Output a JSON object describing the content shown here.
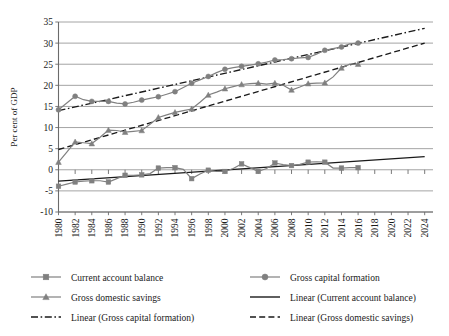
{
  "chart_data": {
    "type": "line",
    "title": "",
    "xlabel": "",
    "ylabel": "Per cent of GDP",
    "ylim": [
      -10,
      35
    ],
    "ytick_values": [
      35,
      30,
      25,
      20,
      15,
      10,
      5,
      0,
      -5,
      -10
    ],
    "ytick_labels": [
      "35",
      "30",
      "25",
      "20",
      "15",
      "10",
      "5",
      "0",
      "-5",
      "-10"
    ],
    "xlim": [
      1980,
      2025
    ],
    "x": [
      1980,
      1981,
      1982,
      1983,
      1984,
      1985,
      1986,
      1987,
      1988,
      1989,
      1990,
      1991,
      1992,
      1993,
      1994,
      1995,
      1996,
      1997,
      1998,
      1999,
      2000,
      2001,
      2002,
      2003,
      2004,
      2005,
      2006,
      2007,
      2008,
      2009,
      2010,
      2011,
      2012,
      2013,
      2014,
      2015,
      2016
    ],
    "xtick_labels": [
      "1980",
      "1982",
      "1984",
      "1986",
      "1988",
      "1990",
      "1992",
      "1994",
      "1996",
      "1998",
      "2000",
      "2002",
      "2004",
      "2006",
      "2008",
      "2010",
      "2012",
      "2014",
      "2016",
      "2018",
      "2020",
      "2022",
      "2024"
    ],
    "grid": true,
    "legend_position": "bottom",
    "series": [
      {
        "name": "Current account balance",
        "marker": "square",
        "style": "solid-marker",
        "color": "#808080",
        "values": [
          -3.9,
          -3.4,
          -2.9,
          -2.7,
          -2.6,
          -2.6,
          -2.9,
          -2.1,
          -1.3,
          -1.3,
          -1.2,
          -0.9,
          0.4,
          0.5,
          0.5,
          0.1,
          -2.1,
          -1.0,
          -0.1,
          -0.4,
          -0.4,
          0.3,
          1.4,
          0.5,
          -0.4,
          0.3,
          1.6,
          1.2,
          1.0,
          1.3,
          1.8,
          1.9,
          1.8,
          0.4,
          0.4,
          0.5,
          0.5
        ]
      },
      {
        "name": "Gross domestic savings",
        "marker": "triangle",
        "style": "solid-marker",
        "color": "#808080",
        "values": [
          1.8,
          4.2,
          6.6,
          6.4,
          6.2,
          7.7,
          9.4,
          9.3,
          8.9,
          9.1,
          9.3,
          10.8,
          12.4,
          13.0,
          13.6,
          14.0,
          14.4,
          16.0,
          17.7,
          18.4,
          19.2,
          19.7,
          20.2,
          20.4,
          20.5,
          20.3,
          20.5,
          20.0,
          18.9,
          19.6,
          20.4,
          20.5,
          20.6,
          22.0,
          24.1,
          25.0,
          25.0
        ]
      },
      {
        "name": "Gross capital formation",
        "marker": "circle",
        "style": "solid-marker",
        "color": "#808080",
        "values": [
          14.2,
          15.8,
          17.4,
          16.6,
          16.2,
          16.2,
          16.2,
          15.8,
          15.6,
          16.0,
          16.5,
          16.9,
          17.3,
          17.9,
          18.5,
          19.5,
          20.5,
          21.3,
          22.1,
          23.0,
          23.8,
          24.2,
          24.5,
          24.8,
          25.1,
          25.5,
          26.0,
          26.1,
          26.3,
          26.5,
          26.6,
          27.4,
          28.3,
          28.7,
          29.1,
          29.8,
          30.0
        ]
      }
    ],
    "trendlines": [
      {
        "name": "Linear (Current account balance)",
        "style": "solid",
        "color": "#1a1a1a",
        "x0": 1980,
        "y0": -2.7,
        "x1": 2024,
        "y1": 3.1
      },
      {
        "name": "Linear (Gross capital formation)",
        "style": "dash-dot",
        "color": "#1a1a1a",
        "x0": 1980,
        "y0": 14.0,
        "x1": 2024,
        "y1": 33.5
      },
      {
        "name": "Linear (Gross domestic savings)",
        "style": "dashed",
        "color": "#1a1a1a",
        "x0": 1980,
        "y0": 4.8,
        "x1": 2024,
        "y1": 30.0
      }
    ]
  },
  "legend": {
    "items": [
      {
        "label": "Current account balance",
        "kind": "marker-square"
      },
      {
        "label": "Gross capital formation",
        "kind": "marker-circle"
      },
      {
        "label": "Gross domestic savings",
        "kind": "marker-triangle"
      },
      {
        "label": "Linear (Current account balance)",
        "kind": "line-solid"
      },
      {
        "label": "Linear (Gross capital formation)",
        "kind": "line-dashdot"
      },
      {
        "label": "Linear (Gross domestic savings)",
        "kind": "line-dashed"
      }
    ]
  },
  "colors": {
    "series_gray": "#808080",
    "trend_black": "#1a1a1a",
    "grid": "#9a9a9a",
    "background": "#ffffff"
  }
}
